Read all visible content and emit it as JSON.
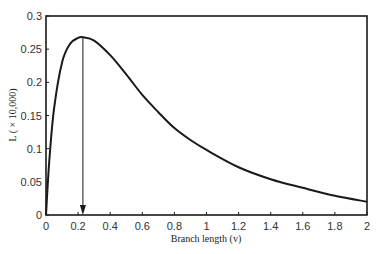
{
  "chart_data": {
    "type": "line",
    "title": "",
    "xlabel": "Branch length (v)",
    "ylabel": "L ( × 10,000)",
    "xlim": [
      0,
      2
    ],
    "ylim": [
      0,
      0.3
    ],
    "x_ticks": [
      "0",
      "0.2",
      "0.4",
      "0.6",
      "0.8",
      "1",
      "1.2",
      "1.4",
      "1.6",
      "1.8",
      "2"
    ],
    "y_ticks": [
      "0",
      "0.05",
      "0.1",
      "0.15",
      "0.2",
      "0.25",
      "0.3"
    ],
    "grid": false,
    "legend": null,
    "series": [
      {
        "name": "Likelihood",
        "x": [
          0,
          0.02,
          0.05,
          0.1,
          0.15,
          0.2,
          0.23,
          0.3,
          0.4,
          0.5,
          0.6,
          0.7,
          0.8,
          0.9,
          1.0,
          1.2,
          1.4,
          1.6,
          1.8,
          2.0
        ],
        "values": [
          0,
          0.08,
          0.16,
          0.23,
          0.258,
          0.267,
          0.268,
          0.263,
          0.241,
          0.212,
          0.181,
          0.155,
          0.131,
          0.113,
          0.098,
          0.072,
          0.054,
          0.041,
          0.029,
          0.02
        ]
      }
    ],
    "annotations": [
      {
        "type": "arrow",
        "label": "maximum likelihood estimate",
        "x": 0.23,
        "from_y": 0.268,
        "to_y": 0
      }
    ]
  }
}
